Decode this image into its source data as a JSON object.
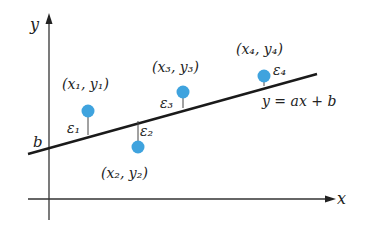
{
  "diagram": {
    "axes": {
      "x_label": "x",
      "y_label": "y"
    },
    "intercept_label": "b",
    "line_equation": "y = ax + b",
    "points": [
      {
        "label": "(x₁, y₁)",
        "residual": "ε₁"
      },
      {
        "label": "(x₂, y₂)",
        "residual": "ε₂"
      },
      {
        "label": "(x₃, y₃)",
        "residual": "ε₃"
      },
      {
        "label": "(x₄, y₄)",
        "residual": "ε₄"
      }
    ],
    "colors": {
      "point": "#3fa3de",
      "line": "#1a1a1a",
      "axis": "#333333"
    }
  }
}
